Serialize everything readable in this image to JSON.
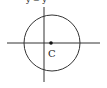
{
  "diagram": {
    "top_caption_fragment": "y = y",
    "center_label": "C",
    "colors": {
      "stroke": "#333333",
      "background": "#ffffff",
      "point": "#111111"
    },
    "geometry": {
      "circle_center": [
        52,
        43
      ],
      "circle_radius": 28,
      "x_axis": {
        "x1": 7,
        "x2": 100,
        "y": 43
      },
      "y_axis": {
        "x": 44,
        "y1": 7,
        "y2": 82
      },
      "center_point": [
        51,
        43
      ]
    }
  }
}
